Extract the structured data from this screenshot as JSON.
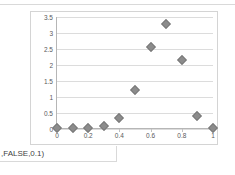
{
  "page": {
    "background": "#ffffff",
    "formula_fragment": ",FALSE,0.1)"
  },
  "chart_data": {
    "type": "scatter",
    "title": "",
    "subtitle": "",
    "xlabel": "",
    "ylabel": "",
    "legend": [],
    "legend_position": "none",
    "grid": true,
    "grid_axis": "y",
    "marker": {
      "shape": "diamond",
      "color": "#8c8c8c",
      "edge_color": "#7a7a7a",
      "size": 7
    },
    "xlim": [
      0,
      1
    ],
    "ylim": [
      0,
      3.5
    ],
    "xticks": [
      0,
      0.2,
      0.4,
      0.6,
      0.8,
      1
    ],
    "xtick_labels": [
      "0",
      "0.2",
      "0.4",
      "0.6",
      "0.8",
      "1"
    ],
    "yticks": [
      0,
      0.5,
      1,
      1.5,
      2,
      2.5,
      3,
      3.5
    ],
    "ytick_labels": [
      "0",
      "0.5",
      "1",
      "1.5",
      "2",
      "2.5",
      "3",
      "3.5"
    ],
    "x": [
      0,
      0.1,
      0.2,
      0.3,
      0.4,
      0.5,
      0.6,
      0.7,
      0.8,
      0.9,
      1
    ],
    "values": [
      0.02,
      0.02,
      0.03,
      0.08,
      0.35,
      1.22,
      2.57,
      3.28,
      2.15,
      0.4,
      0.03
    ],
    "series": [
      {
        "name": "Series1",
        "x": [
          0,
          0.1,
          0.2,
          0.3,
          0.4,
          0.5,
          0.6,
          0.7,
          0.8,
          0.9,
          1
        ],
        "values": [
          0.02,
          0.02,
          0.03,
          0.08,
          0.35,
          1.22,
          2.57,
          3.28,
          2.15,
          0.4,
          0.03
        ]
      }
    ]
  }
}
